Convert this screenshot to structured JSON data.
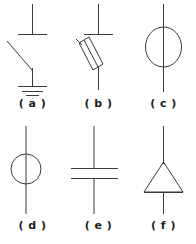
{
  "figure": {
    "background_color": "#ffffff",
    "stroke_color": "#3a3a3a",
    "caption_color": "#1d1d1d",
    "width": 196,
    "height": 244,
    "columns": 3,
    "rows": 2
  },
  "symbols": [
    {
      "key": "a",
      "caption": "( a )",
      "name": "switch-with-ground",
      "description": "Vertical terminal lead with horizontal contact bar, open blade switch arm, and earth ground symbol"
    },
    {
      "key": "b",
      "caption": "( b )",
      "name": "fuse-varistor-element",
      "description": "Vertical terminal lead with horizontal bar and an inclined elongated parallelogram element on a diagonal lead"
    },
    {
      "key": "c",
      "caption": "( c )",
      "name": "large-circle-inline",
      "description": "Large circle centred on a vertical lead passing through it"
    },
    {
      "key": "d",
      "caption": "( d )",
      "name": "small-circle-inline",
      "description": "Small circle centred on a vertical lead passing through it"
    },
    {
      "key": "e",
      "caption": "( e )",
      "name": "capacitor",
      "description": "Two parallel horizontal plates with vertical leads above and below"
    },
    {
      "key": "f",
      "caption": "( f )",
      "name": "triangle-diode",
      "description": "Upward pointing triangle with vertical leads at apex and base"
    }
  ]
}
